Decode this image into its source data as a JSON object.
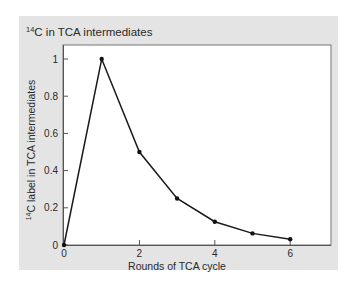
{
  "chart_data": {
    "type": "line",
    "title_super": "14",
    "title_rest": "C in TCA intermediates",
    "xlabel": "Rounds of TCA cycle",
    "ylabel_super": "14",
    "ylabel_rest": "C label in TCA intermediates",
    "x": [
      0,
      1,
      2,
      3,
      4,
      5,
      6
    ],
    "values": [
      0,
      1,
      0.5,
      0.25,
      0.125,
      0.0625,
      0.03125
    ],
    "xlim": [
      0,
      7
    ],
    "ylim": [
      0,
      1.07
    ],
    "xticks": [
      0,
      2,
      4,
      6
    ],
    "xtick_labels": [
      "0",
      "2",
      "4",
      "6"
    ],
    "yticks": [
      0,
      0.2,
      0.4,
      0.6,
      0.8,
      1
    ],
    "ytick_labels": [
      "0",
      "0.2",
      "0.4",
      "0.6",
      "0.8",
      "1"
    ],
    "grid": false,
    "legend": null,
    "colors": {
      "panel_bg": "#e4e4e4",
      "plot_bg": "#ffffff",
      "line": "#1a1a1a",
      "frame": "#8a8a8a"
    }
  }
}
